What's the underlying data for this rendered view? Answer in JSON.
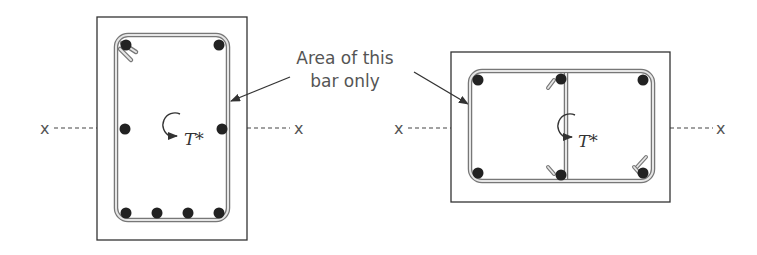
{
  "annotation": {
    "line1": "Area of this",
    "line2": "bar only"
  },
  "axis_label": "x",
  "torque_label": "T*",
  "colors": {
    "outline": "#333333",
    "stirrup_outer": "#777777",
    "stirrup_inner": "#dddddd",
    "bar": "#222222",
    "text": "#555555",
    "dash": "#444444"
  },
  "left_section": {
    "description": "Rectangular beam section, single closed stirrup, 8 longitudinal bars",
    "outer_box": {
      "x": 97,
      "y": 17,
      "w": 150,
      "h": 223
    },
    "stirrup": {
      "x": 116,
      "y": 35,
      "w": 112,
      "h": 185,
      "r": 12
    },
    "bars": [
      {
        "x": 126,
        "y": 45
      },
      {
        "x": 219,
        "y": 45
      },
      {
        "x": 125,
        "y": 129
      },
      {
        "x": 222,
        "y": 129
      },
      {
        "x": 126,
        "y": 213
      },
      {
        "x": 157,
        "y": 213
      },
      {
        "x": 188,
        "y": 213
      },
      {
        "x": 219,
        "y": 213
      }
    ],
    "axis_y": 128
  },
  "right_section": {
    "description": "Wide beam section with two stirrup legs sharing a middle leg, 6 longitudinal bars",
    "outer_box": {
      "x": 451,
      "y": 52,
      "w": 219,
      "h": 150
    },
    "stirrup": {
      "x": 470,
      "y": 71,
      "w": 183,
      "h": 110,
      "r": 12
    },
    "middle_leg_x": 566,
    "bars": [
      {
        "x": 478,
        "y": 80
      },
      {
        "x": 561,
        "y": 79
      },
      {
        "x": 643,
        "y": 80
      },
      {
        "x": 478,
        "y": 173
      },
      {
        "x": 561,
        "y": 175
      },
      {
        "x": 643,
        "y": 173
      }
    ],
    "axis_y": 128
  }
}
